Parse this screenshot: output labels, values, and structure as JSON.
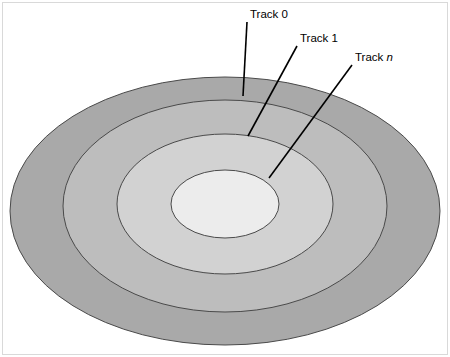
{
  "figure": {
    "background_color": "#ffffff",
    "border_color": "#d9d9d9"
  },
  "labels": [
    {
      "id": "track-0",
      "text": "Track 0",
      "italic_suffix": "",
      "x": 250,
      "y": 18,
      "leader": {
        "x1": 247,
        "y1": 22,
        "x2": 243,
        "y2": 96
      }
    },
    {
      "id": "track-1",
      "text": "Track 1",
      "italic_suffix": "",
      "x": 300,
      "y": 42,
      "leader": {
        "x1": 297,
        "y1": 46,
        "x2": 248,
        "y2": 136
      }
    },
    {
      "id": "track-n",
      "text": "Track ",
      "italic_suffix": "n",
      "x": 355,
      "y": 61,
      "leader": {
        "x1": 352,
        "y1": 65,
        "x2": 269,
        "y2": 178
      }
    }
  ],
  "rings": [
    {
      "id": "ring-outer",
      "name": "outermost-track-band",
      "cx": 225,
      "cy": 211,
      "rx": 215,
      "ry": 134,
      "fill": "#a9a9a9",
      "stroke": "#4a4a4a"
    },
    {
      "id": "ring-second",
      "name": "second-track-band",
      "cx": 225,
      "cy": 206,
      "rx": 162,
      "ry": 106,
      "fill": "#bdbdbd",
      "stroke": "#4a4a4a"
    },
    {
      "id": "ring-third",
      "name": "third-track-band",
      "cx": 225,
      "cy": 204,
      "rx": 108,
      "ry": 70,
      "fill": "#d2d2d2",
      "stroke": "#4a4a4a"
    },
    {
      "id": "ring-inner",
      "name": "innermost-track-band",
      "cx": 225,
      "cy": 204,
      "rx": 54,
      "ry": 34,
      "fill": "#ececec",
      "stroke": "#4a4a4a"
    }
  ],
  "leader_style": {
    "color": "#000000",
    "width": 1.6
  }
}
